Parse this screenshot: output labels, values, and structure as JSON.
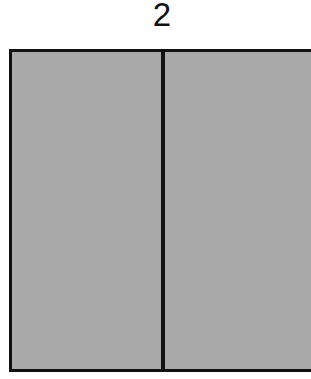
{
  "diagram": {
    "label": "2",
    "shape": {
      "type": "rectangle",
      "parts": 2,
      "fill_color": "#a9a9a9",
      "border_color": "#111111"
    }
  }
}
